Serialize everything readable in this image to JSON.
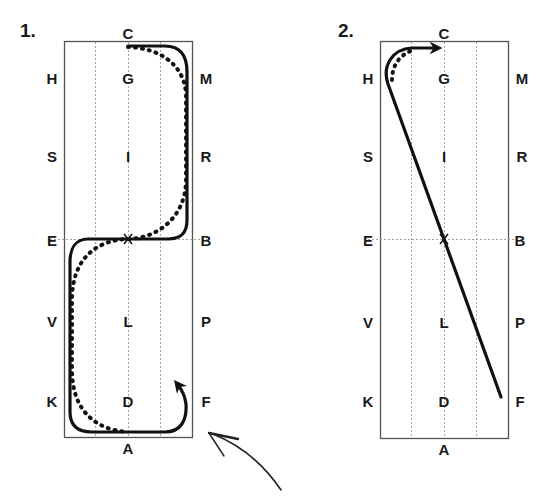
{
  "diagram": {
    "type": "dressage-arena-figures",
    "panels": [
      {
        "number": "1.",
        "description": "Serpentine / S-shaped figure through X from C to A, solid line with dotted alternative, ending with arrow curling up toward F",
        "letters": {
          "top": "C",
          "bottom": "A",
          "left": [
            "H",
            "S",
            "E",
            "V",
            "K"
          ],
          "center": [
            "G",
            "I",
            "X",
            "L",
            "D"
          ],
          "right": [
            "M",
            "R",
            "B",
            "P",
            "F"
          ]
        }
      },
      {
        "number": "2.",
        "description": "Straight diagonal line from F through X toward H, curving to C with arrow; dotted alternative near H",
        "letters": {
          "top": "C",
          "bottom": "A",
          "left": [
            "H",
            "S",
            "E",
            "V",
            "K"
          ],
          "center": [
            "G",
            "I",
            "X",
            "L",
            "D"
          ],
          "right": [
            "M",
            "R",
            "B",
            "P",
            "F"
          ]
        }
      }
    ],
    "annotation": "hand-drawn-arrow-pointing-to-panel-1-corner",
    "colors": {
      "line": "#111111",
      "border": "#555555",
      "grid": "#999999",
      "text": "#1a1a1a"
    }
  }
}
